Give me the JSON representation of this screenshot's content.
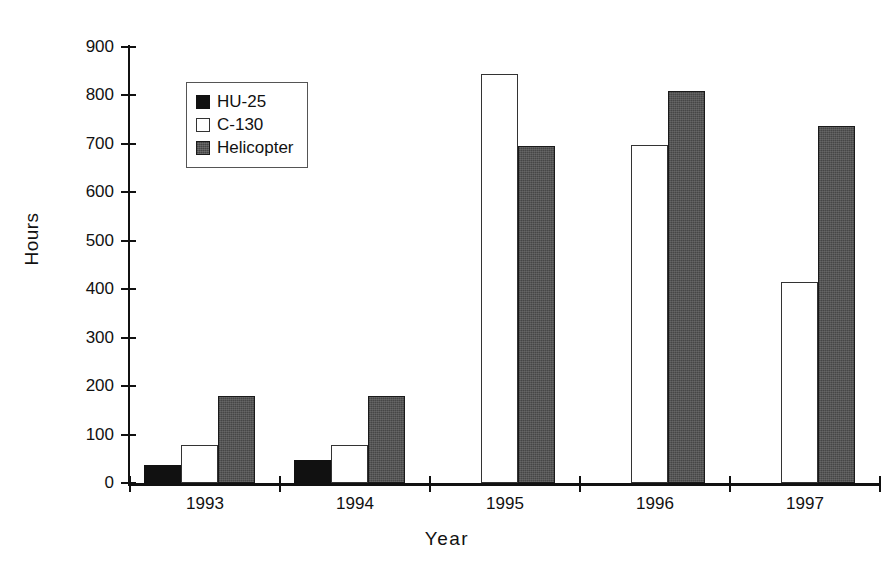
{
  "chart_data": {
    "type": "bar",
    "title": "",
    "xlabel": "Year",
    "ylabel": "Hours",
    "categories": [
      "1993",
      "1994",
      "1995",
      "1996",
      "1997"
    ],
    "series": [
      {
        "name": "HU-25",
        "color": "#111111",
        "values": [
          38,
          47,
          0,
          0,
          0
        ]
      },
      {
        "name": "C-130",
        "color": "#ffffff",
        "values": [
          78,
          78,
          845,
          698,
          415
        ]
      },
      {
        "name": "Helicopter",
        "color": "#555555",
        "values": [
          180,
          179,
          695,
          810,
          736
        ]
      }
    ],
    "ylim": [
      0,
      900
    ],
    "yticks": [
      0,
      100,
      200,
      300,
      400,
      500,
      600,
      700,
      800,
      900
    ],
    "grid": false,
    "legend_position": "upper-left"
  },
  "legend": {
    "items": [
      {
        "label": "HU-25"
      },
      {
        "label": "C-130"
      },
      {
        "label": "Helicopter"
      }
    ]
  }
}
